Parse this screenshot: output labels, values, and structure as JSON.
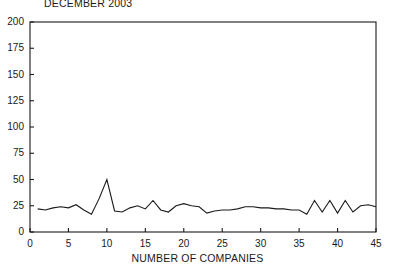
{
  "chart_data": {
    "type": "line",
    "title": "DECEMBER 2003",
    "xlabel": "NUMBER OF COMPANIES",
    "ylabel": "",
    "xlim": [
      0,
      45
    ],
    "ylim": [
      0,
      200
    ],
    "xticks": [
      0,
      5,
      10,
      15,
      20,
      25,
      30,
      35,
      40,
      45
    ],
    "yticks": [
      0,
      25,
      50,
      75,
      100,
      125,
      150,
      175,
      200
    ],
    "grid": false,
    "legend": false,
    "line_color": "#1a1a1a",
    "x": [
      1,
      2,
      3,
      4,
      5,
      6,
      7,
      8,
      9,
      10,
      11,
      12,
      13,
      14,
      15,
      16,
      17,
      18,
      19,
      20,
      21,
      22,
      23,
      24,
      25,
      26,
      27,
      28,
      29,
      30,
      31,
      32,
      33,
      34,
      35,
      36,
      37,
      38,
      39,
      40,
      41,
      42,
      43,
      44,
      45
    ],
    "values": [
      22,
      21,
      23,
      24,
      23,
      26,
      21,
      17,
      32,
      50,
      20,
      19,
      23,
      25,
      22,
      30,
      21,
      19,
      25,
      27,
      25,
      24,
      18,
      20,
      21,
      21,
      22,
      24,
      24,
      23,
      23,
      22,
      22,
      21,
      21,
      17,
      30,
      19,
      30,
      18,
      30,
      19,
      25,
      26,
      24
    ],
    "annotations": []
  },
  "axes": {
    "ytick_labels": [
      "200",
      "175",
      "150",
      "125",
      "100",
      "75",
      "50",
      "25",
      "0"
    ],
    "xtick_labels": [
      "0",
      "5",
      "10",
      "15",
      "20",
      "25",
      "30",
      "35",
      "40",
      "45"
    ]
  }
}
